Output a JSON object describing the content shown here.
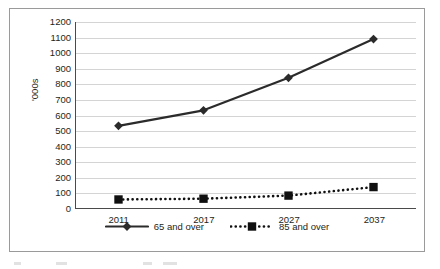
{
  "chart_data": {
    "type": "line",
    "title": "",
    "xlabel": "",
    "ylabel": "'000s",
    "categories": [
      "2011",
      "2017",
      "2027",
      "2037"
    ],
    "ylim": [
      0,
      1200
    ],
    "ytick_step": 100,
    "yticks": [
      "1200",
      "1100",
      "1000",
      "900",
      "800",
      "700",
      "600",
      "500",
      "400",
      "300",
      "200",
      "100",
      "0"
    ],
    "grid": true,
    "legend_position": "bottom",
    "series": [
      {
        "name": "65 and over",
        "values": [
          530,
          630,
          840,
          1090
        ],
        "marker": "diamond",
        "line_style": "solid",
        "color": "#2b2b2b"
      },
      {
        "name": "85 and over",
        "values": [
          55,
          60,
          80,
          135
        ],
        "marker": "square",
        "line_style": "dotted",
        "color": "#101010"
      }
    ]
  },
  "legend": {
    "items": [
      {
        "label": "65 and over",
        "marker": "diamond-marker-icon",
        "line_style": "solid"
      },
      {
        "label": "85 and over",
        "marker": "square-marker-icon",
        "line_style": "dotted"
      }
    ]
  },
  "colors": {
    "series_65_and_over": "#2b2b2b",
    "series_85_and_over": "#101010",
    "gridline": "#d4d4d4",
    "axis": "#4a4a4a",
    "frame": "#9a9a9a",
    "text": "#231f20"
  }
}
